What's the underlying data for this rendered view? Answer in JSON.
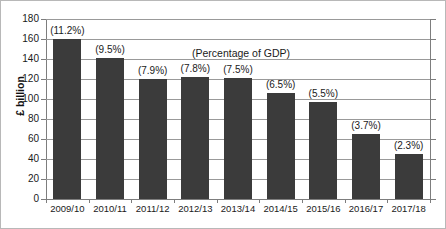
{
  "chart_data": {
    "type": "bar",
    "title": "",
    "annotation": "(Percentage of GDP)",
    "xlabel": "",
    "ylabel": "£ billion",
    "ylim": [
      0,
      180
    ],
    "yticks": [
      0,
      20,
      40,
      60,
      80,
      100,
      120,
      140,
      160,
      180
    ],
    "grid": true,
    "legend": "none",
    "bar_color": "#3b3b3b",
    "categories": [
      "2009/10",
      "2010/11",
      "2011/12",
      "2012/13",
      "2013/14",
      "2014/15",
      "2015/16",
      "2016/17",
      "2017/18"
    ],
    "values": [
      160,
      141,
      120,
      122,
      121,
      106,
      97,
      65,
      45
    ],
    "data_labels": [
      "(11.2%)",
      "(9.5%)",
      "(7.9%)",
      "(7.8%)",
      "(7.5%)",
      "(6.5%)",
      "(5.5%)",
      "(3.7%)",
      "(2.3%)"
    ],
    "percent_values": [
      11.2,
      9.5,
      7.9,
      7.8,
      7.5,
      6.5,
      5.5,
      3.7,
      2.3
    ]
  }
}
